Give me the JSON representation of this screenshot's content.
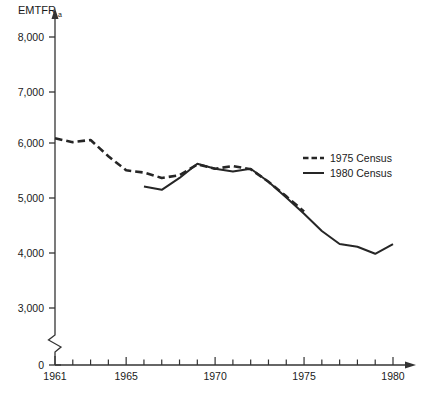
{
  "chart_data": {
    "type": "line",
    "title": "",
    "ylabel": "EMTFR",
    "ylabel_subscript": "a",
    "xlabel": "",
    "ylim": [
      0,
      8000
    ],
    "xlim": [
      1960,
      1980.6
    ],
    "grid": false,
    "legend_position": "center-right",
    "y_ticks": [
      0,
      3000,
      4000,
      5000,
      6000,
      7000,
      8000
    ],
    "y_tick_labels": [
      "0",
      "3,000",
      "4,000",
      "5,000",
      "6,000",
      "7,000",
      "8,000"
    ],
    "y_axis_break": true,
    "y_axis_break_between": [
      0,
      3000
    ],
    "x_ticks": [
      1961,
      1962,
      1963,
      1964,
      1965,
      1966,
      1967,
      1968,
      1969,
      1970,
      1971,
      1972,
      1973,
      1974,
      1975,
      1976,
      1977,
      1978,
      1979,
      1980
    ],
    "x_tick_labels_shown": [
      "1961",
      "1965",
      "1970",
      "1975",
      "1980"
    ],
    "x_labeled_ticks": [
      1961,
      1965,
      1970,
      1975,
      1980
    ],
    "series": [
      {
        "name": "1975 Census",
        "style": "dashed",
        "color": "#262626",
        "x": [
          1961,
          1962,
          1963,
          1964,
          1965,
          1966,
          1967,
          1968,
          1969,
          1970,
          1971,
          1972,
          1973,
          1974,
          1975
        ],
        "values": [
          6130,
          6060,
          6100,
          5800,
          5540,
          5500,
          5400,
          5450,
          5650,
          5570,
          5620,
          5560,
          5330,
          5060,
          4780
        ]
      },
      {
        "name": "1980 Census",
        "style": "solid",
        "color": "#262626",
        "x": [
          1966,
          1967,
          1968,
          1969,
          1970,
          1971,
          1972,
          1973,
          1974,
          1975,
          1976,
          1977,
          1978,
          1979,
          1980
        ],
        "values": [
          5240,
          5180,
          5400,
          5660,
          5570,
          5520,
          5570,
          5330,
          5040,
          4740,
          4420,
          4180,
          4130,
          4000,
          4180
        ]
      }
    ],
    "legend_entries": [
      {
        "label": "1975 Census",
        "style": "dashed"
      },
      {
        "label": "1980 Census",
        "style": "solid"
      }
    ]
  }
}
